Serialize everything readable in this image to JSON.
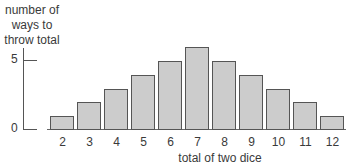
{
  "chart_data": {
    "type": "bar",
    "title": "",
    "xlabel": "total of two dice",
    "ylabel": "number of ways to throw total",
    "ylabel_lines": [
      "number of",
      "ways to",
      "throw total"
    ],
    "categories": [
      "2",
      "3",
      "4",
      "5",
      "6",
      "7",
      "8",
      "9",
      "10",
      "11",
      "12"
    ],
    "values": [
      1,
      2,
      3,
      4,
      5,
      6,
      5,
      4,
      3,
      2,
      1
    ],
    "yticks": [
      0,
      5
    ],
    "ylim": [
      0,
      6
    ],
    "grid": false,
    "bar_color": "#cccccc",
    "bar_edge_color": "#555555"
  }
}
